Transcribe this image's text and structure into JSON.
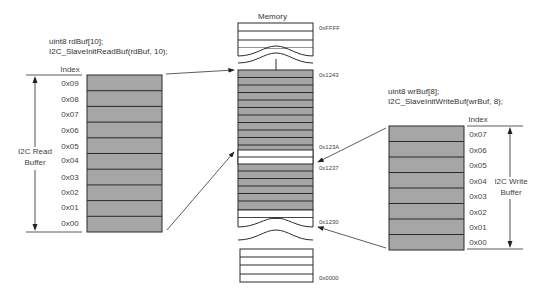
{
  "read_buffer": {
    "code_line1": "uint8 rdBuf[10];",
    "code_line2": "I2C_SlaveInitReadBuf(rdBuf, 10);",
    "index_header": "Index",
    "indices": [
      "0x09",
      "0x08",
      "0x07",
      "0x06",
      "0x05",
      "0x04",
      "0x03",
      "0x02",
      "0x01",
      "0x00"
    ],
    "label_line1": "I2C Read",
    "label_line2": "Buffer"
  },
  "memory": {
    "title": "Memory",
    "addresses": {
      "top": "0xFFFF",
      "a1243": "0x1243",
      "a123A": "0x123A",
      "a1237": "0x1237",
      "a1230": "0x1230",
      "bottom": "0x0000"
    }
  },
  "write_buffer": {
    "code_line1": "uint8 wrBuf[8];",
    "code_line2": "I2C_SlaveInitWriteBuf(wrBuf, 8);",
    "index_header": "Index",
    "indices": [
      "0x07",
      "0x06",
      "0x05",
      "0x04",
      "0x03",
      "0x02",
      "0x01",
      "0x00"
    ],
    "label_line1": "I2C Write",
    "label_line2": "Buffer"
  },
  "colors": {
    "cell_fill": "#a6a6a6",
    "cell_border": "#2b2b2b",
    "empty_fill": "#ffffff",
    "line": "#333333"
  }
}
